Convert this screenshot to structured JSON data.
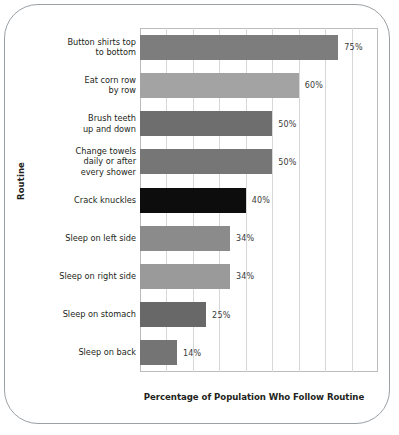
{
  "figure": {
    "frame_color": "#9aa0a4",
    "background": "#ffffff"
  },
  "chart_data": {
    "type": "bar",
    "orientation": "horizontal",
    "title": "",
    "xlabel": "Percentage of Population Who Follow Routine",
    "ylabel": "Routine",
    "xlim": [
      0,
      90
    ],
    "grid": "vertical",
    "gridline_values": [
      0,
      10,
      20,
      30,
      40,
      50,
      60,
      70,
      80,
      90
    ],
    "legend": "none",
    "value_suffix": "%",
    "categories": [
      "Button shirts top\nto bottom",
      "Eat corn row\nby row",
      "Brush teeth\nup and down",
      "Change towels\ndaily or after\nevery shower",
      "Crack knuckles",
      "Sleep on left side",
      "Sleep on right side",
      "Sleep on stomach",
      "Sleep on back"
    ],
    "values": [
      75,
      60,
      50,
      50,
      40,
      34,
      34,
      25,
      14
    ],
    "value_labels": [
      "75%",
      "60%",
      "50%",
      "50%",
      "40%",
      "34%",
      "34%",
      "25%",
      "14%"
    ],
    "bar_colors": [
      "#7d7d7d",
      "#a3a3a3",
      "#6e6e6e",
      "#767676",
      "#0d0d0d",
      "#8b8b8b",
      "#9a9a9a",
      "#686868",
      "#747474"
    ]
  }
}
